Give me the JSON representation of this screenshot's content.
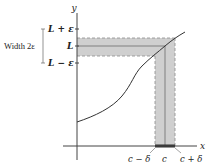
{
  "figure": {
    "type": "epsilon-delta limit diagram",
    "axes": {
      "x_label": "x",
      "y_label": "y"
    },
    "y_ticks": {
      "upper": "L + ε",
      "center": "L",
      "lower": "L − ε"
    },
    "x_ticks": {
      "left": "c − δ",
      "center": "c",
      "right": "c + δ"
    },
    "bracket_label": "Width 2ε",
    "colors": {
      "band": "#c9c9c9",
      "axis": "#444444",
      "curve": "#333333",
      "dash": "#888888"
    }
  }
}
